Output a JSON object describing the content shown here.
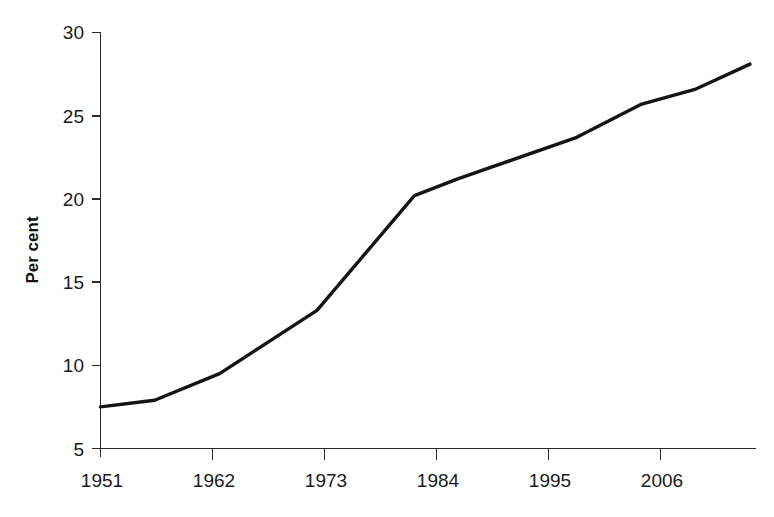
{
  "chart_data": {
    "type": "line",
    "title": "",
    "subtitle": "",
    "xlabel": "",
    "ylabel": "Per cent",
    "xlim": [
      1951,
      2011
    ],
    "ylim": [
      5,
      30
    ],
    "grid": false,
    "legend": false,
    "legend_position": "none",
    "line_color": "#141414",
    "xticks": [
      1951,
      1962,
      1973,
      1984,
      1995,
      2006
    ],
    "xtick_labels": [
      "1951",
      "1962",
      "1973",
      "1984",
      "1995",
      "2006"
    ],
    "yticks": [
      5,
      10,
      15,
      20,
      25,
      30
    ],
    "ytick_labels": [
      "5",
      "10",
      "15",
      "20",
      "25",
      "30"
    ],
    "series": [
      {
        "name": "Per cent",
        "x": [
          1951,
          1956,
          1962,
          1971,
          1980,
          1984,
          1995,
          2001,
          2006,
          2011
        ],
        "values": [
          7.5,
          7.9,
          9.5,
          13.3,
          20.2,
          21.2,
          23.7,
          25.7,
          26.6,
          28.1
        ]
      }
    ],
    "annotations": []
  },
  "axes": {
    "y_axis_label": "Per cent"
  }
}
